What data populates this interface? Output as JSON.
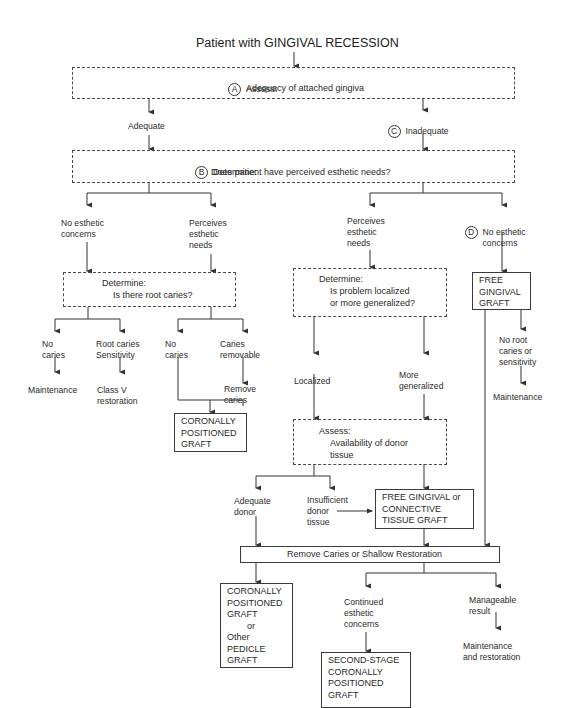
{
  "title": "Patient with GINGIVAL RECESSION",
  "nodes": {
    "A": {
      "marker": "A",
      "heading": "Assess:",
      "text": "Adequacy of attached gingiva"
    },
    "adequate": "Adequate",
    "C": {
      "marker": "C",
      "text": "Inadequate"
    },
    "B": {
      "marker": "B",
      "heading": "Determine:",
      "text": "Does patient have perceived esthetic needs?"
    },
    "left_no_esthetic": "No esthetic\nconcerns",
    "left_perceives": "Perceives\nesthetic\nneeds",
    "right_perceives": "Perceives\nesthetic\nneeds",
    "D": {
      "marker": "D",
      "text": "No esthetic\nconcerns"
    },
    "root_caries_box": {
      "heading": "Determine:",
      "text": "Is there root caries?"
    },
    "no_caries_1": "No\ncaries",
    "root_caries_sensitivity": "Root caries\nSensitivity",
    "no_caries_2": "No\ncaries",
    "caries_removable": "Caries\nremovable",
    "maintenance_1": "Maintenance",
    "class_v": "Class V\nrestoration",
    "remove_caries": "Remove\ncaries",
    "cpg_1": "CORONALLY\nPOSITIONED\nGRAFT",
    "localized_box": {
      "heading": "Determine:",
      "text": "Is problem localized\nor more generalized?"
    },
    "localized": "Localized",
    "more_generalized": "More\ngeneralized",
    "free_gingival_graft": "FREE\nGINGIVAL\nGRAFT",
    "no_root_caries": "No root\ncaries or\nsensitivity",
    "maintenance_2": "Maintenance",
    "donor_box": {
      "heading": "Assess:",
      "text": "Availability of donor\ntissue"
    },
    "adequate_donor": "Adequate\ndonor",
    "insufficient_donor": "Insufficient\ndonor\ntissue",
    "fgg_or_ctg": "FREE GINGIVAL or\nCONNECTIVE\nTISSUE GRAFT",
    "remove_caries_bar": "Remove Caries or Shallow Restoration",
    "cpg_or_pedicle": "CORONALLY\nPOSITIONED\nGRAFT\n        or\nOther\nPEDICLE\nGRAFT",
    "continued_esthetic": "Continued\nesthetic\nconcerns",
    "manageable_result": "Manageable\nresult",
    "second_stage": "SECOND-STAGE\nCORONALLY\nPOSITIONED\nGRAFT",
    "maintenance_restoration": "Maintenance\nand restoration"
  },
  "colors": {
    "line": "#333333",
    "background": "#ffffff"
  }
}
